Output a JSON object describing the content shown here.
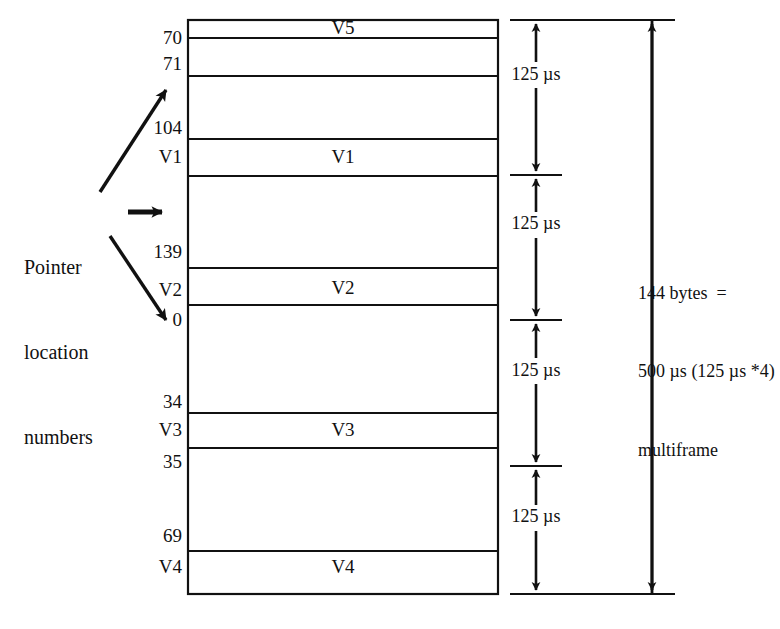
{
  "figure": {
    "ink_color": "#111111",
    "background": "#ffffff"
  },
  "left_annotation": {
    "line1": "Pointer",
    "line2": "location",
    "line3": "numbers",
    "arrows": [
      {
        "name": "up-arrow-to-71",
        "direction": "up-right"
      },
      {
        "name": "right-arrow-to-middle",
        "direction": "right"
      },
      {
        "name": "down-arrow-to-0",
        "direction": "down-right"
      }
    ]
  },
  "pointer_numbers": [
    {
      "value": "70",
      "y": 38
    },
    {
      "value": "71",
      "y": 62
    },
    {
      "value": "104",
      "y": 126
    },
    {
      "value": "V1",
      "y": 155
    },
    {
      "value": "139",
      "y": 250
    },
    {
      "value": "V2",
      "y": 288
    },
    {
      "value": "0",
      "y": 318
    },
    {
      "value": "34",
      "y": 400
    },
    {
      "value": "V3",
      "y": 428
    },
    {
      "value": "35",
      "y": 460
    },
    {
      "value": "69",
      "y": 534
    },
    {
      "value": "V4",
      "y": 565
    }
  ],
  "frame_column": {
    "left": 188,
    "right": 498,
    "top": 20,
    "bottom": 594,
    "row_labels": [
      {
        "label": "V5",
        "y": 47
      },
      {
        "label": "V1",
        "y": 155
      },
      {
        "label": "V2",
        "y": 288
      },
      {
        "label": "V3",
        "y": 428
      },
      {
        "label": "V4",
        "y": 565
      }
    ],
    "divider_y": [
      38,
      76,
      139,
      176,
      268,
      305,
      413,
      448,
      551
    ]
  },
  "timing_column": {
    "segments": [
      {
        "label": "125 µs",
        "top": 20,
        "bottom": 175
      },
      {
        "label": "125 µs",
        "top": 175,
        "bottom": 320
      },
      {
        "label": "125 µs",
        "top": 320,
        "bottom": 466
      },
      {
        "label": "125 µs",
        "top": 466,
        "bottom": 594
      }
    ]
  },
  "total_annotation": {
    "line1": "144 bytes  =",
    "line2": "500 µs (125 µs *4)",
    "line3": "multiframe",
    "arrow_top": 20,
    "arrow_bottom": 594
  }
}
